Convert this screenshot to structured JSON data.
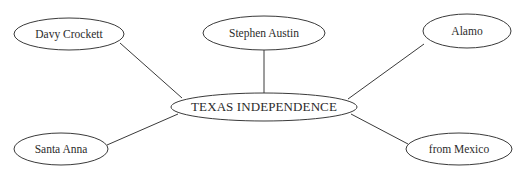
{
  "diagram": {
    "type": "concept-map",
    "title_node": "TEXAS INDEPENDENCE",
    "background_color": "#ffffff",
    "stroke_color": "#3a3a3a",
    "text_color": "#2b2b2b",
    "nodes": [
      {
        "id": "davy-crockett",
        "label": "Davy Crockett",
        "cx": 69,
        "cy": 34,
        "rx": 55,
        "ry": 16
      },
      {
        "id": "stephen-austin",
        "label": "Stephen Austin",
        "cx": 264,
        "cy": 33,
        "rx": 61,
        "ry": 17
      },
      {
        "id": "alamo",
        "label": "Alamo",
        "cx": 467,
        "cy": 31,
        "rx": 44,
        "ry": 17
      },
      {
        "id": "texas-independence",
        "label": "TEXAS INDEPENDENCE",
        "cx": 264,
        "cy": 107,
        "rx": 93,
        "ry": 14
      },
      {
        "id": "santa-anna",
        "label": "Santa Anna",
        "cx": 61,
        "cy": 149,
        "rx": 47,
        "ry": 16
      },
      {
        "id": "from-mexico",
        "label": "from Mexico",
        "cx": 459,
        "cy": 149,
        "rx": 53,
        "ry": 16
      }
    ],
    "edges": [
      {
        "id": "edge-davy-crockett",
        "from": "davy-crockett",
        "to": "texas-independence",
        "x1": 120,
        "y1": 43,
        "x2": 182,
        "y2": 98
      },
      {
        "id": "edge-stephen-austin",
        "from": "stephen-austin",
        "to": "texas-independence",
        "x1": 264,
        "y1": 50,
        "x2": 264,
        "y2": 94
      },
      {
        "id": "edge-alamo",
        "from": "alamo",
        "to": "texas-independence",
        "x1": 424,
        "y1": 44,
        "x2": 348,
        "y2": 99
      },
      {
        "id": "edge-santa-anna",
        "from": "santa-anna",
        "to": "texas-independence",
        "x1": 107,
        "y1": 145,
        "x2": 178,
        "y2": 114
      },
      {
        "id": "edge-from-mexico",
        "from": "from-mexico",
        "to": "texas-independence",
        "x1": 408,
        "y1": 144,
        "x2": 351,
        "y2": 114
      }
    ]
  }
}
